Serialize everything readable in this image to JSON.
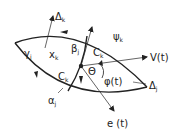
{
  "diagram": {
    "labels": {
      "delta_k": "Δ",
      "delta_k_sub": "k",
      "psi_k": "ψ",
      "psi_k_sub": "k",
      "gamma_j": "γ",
      "gamma_j_sub": "j",
      "x_k": "x",
      "x_k_sub": "k",
      "beta_j": "β",
      "beta_j_sub": "j",
      "c_k_upper": "C",
      "c_k_upper_sub": "k",
      "c_k_lower": "C",
      "c_k_lower_sub": "k",
      "v_t": "V(t)",
      "theta": "Θ",
      "phi_t": "φ(t)",
      "delta_j": "Δ",
      "delta_j_sub": "j",
      "alpha_j": "α",
      "alpha_j_sub": "j",
      "e_t": "e (t)"
    },
    "colors": {
      "stroke": "#222222",
      "background": "#ffffff"
    }
  }
}
